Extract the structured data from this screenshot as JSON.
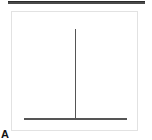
{
  "figure": {
    "panel_label": "A",
    "width_px": 152,
    "height_px": 140,
    "background_color": "#ffffff",
    "top_rule": {
      "name": "figure-top-divider",
      "color": "#4a4a4a",
      "left_px": 8,
      "top_px": 1,
      "width_px": 137,
      "height_px": 3
    },
    "plot_frame": {
      "border_color": "#e2e2e2",
      "fill_color": "#ffffff",
      "left_px": 11,
      "top_px": 11,
      "width_px": 127,
      "height_px": 120
    },
    "trace_color": "#555555"
  },
  "chart_data": {
    "type": "bar",
    "title": "",
    "subtitle": "",
    "xlabel": "",
    "ylabel": "",
    "categories": [
      "0",
      "1",
      "2",
      "3",
      "4",
      "5",
      "6",
      "7",
      "8",
      "9",
      "10"
    ],
    "values": [
      0,
      0,
      0,
      0,
      0,
      100,
      0,
      0,
      0,
      0,
      0
    ],
    "series": [
      {
        "name": "spike",
        "values": [
          0,
          0,
          0,
          0,
          0,
          100,
          0,
          0,
          0,
          0,
          0
        ]
      }
    ],
    "xlim": [
      0,
      10
    ],
    "ylim": [
      0,
      100
    ],
    "grid": false,
    "legend": false,
    "legend_position": "none",
    "xtick_labels": [],
    "ytick_labels": [],
    "annotations": [
      {
        "text": "A",
        "role": "panel-label",
        "position": "bottom-left-outside"
      }
    ],
    "baseline": {
      "y_value": 0,
      "x_start": 0.95,
      "x_end": 9.2,
      "color": "#555555",
      "line_width_px": 1.5
    },
    "spike": {
      "x_value": 5,
      "y_value": 100,
      "color": "#555555",
      "line_width_px": 1.5
    }
  }
}
